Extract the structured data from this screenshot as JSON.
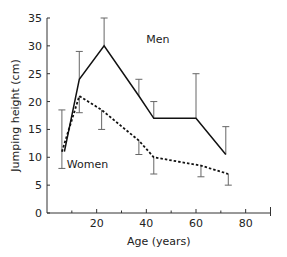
{
  "chart_data": {
    "type": "line",
    "title": "",
    "xlabel": "Age (years)",
    "ylabel": "Jumping height (cm)",
    "xlim": [
      0,
      90
    ],
    "ylim": [
      0,
      35
    ],
    "xticks": [
      20,
      40,
      60,
      80
    ],
    "xminor_ticks": [
      10,
      30,
      50,
      70,
      90
    ],
    "yticks": [
      0,
      5,
      10,
      15,
      20,
      25,
      30,
      35
    ],
    "grid": false,
    "legend": "inline labels",
    "series": [
      {
        "name": "Men",
        "style": "solid",
        "x": [
          7,
          13,
          23,
          37,
          43,
          60,
          72
        ],
        "values": [
          11,
          24,
          30,
          21,
          17,
          17,
          10.5
        ],
        "error_upper": [
          null,
          29,
          35,
          24,
          20,
          25,
          15.5
        ],
        "label_pos": [
          40,
          30.5
        ]
      },
      {
        "name": "Women",
        "style": "dashed",
        "x": [
          6,
          13,
          22,
          37,
          43,
          62,
          73
        ],
        "values": [
          11,
          21,
          18.5,
          13,
          10,
          8.5,
          7
        ],
        "error_lower": [
          8,
          18,
          15,
          10.5,
          7,
          6.5,
          5
        ],
        "error_upper": [
          18.5,
          null,
          null,
          null,
          null,
          null,
          null
        ],
        "label_pos": [
          8,
          8
        ]
      }
    ]
  }
}
